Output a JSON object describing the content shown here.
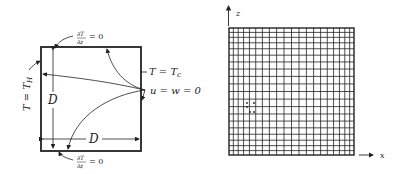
{
  "left_diagram": {
    "square": {
      "x": 41,
      "y": 47,
      "w": 100,
      "h": 104
    },
    "labels": {
      "top_bc_num": "∂T",
      "top_bc_den": "∂z",
      "top_bc_eq": "= 0",
      "bottom_bc_num": "∂T",
      "bottom_bc_den": "∂z",
      "bottom_bc_eq": "= 0",
      "left_bc": "T = T",
      "left_bc_sub": "H",
      "right_bc": "T = T",
      "right_bc_sub": "c",
      "no_slip": "u = w = 0",
      "height_dim": "D",
      "width_dim": "D"
    }
  },
  "right_diagram": {
    "grid": {
      "x": 229,
      "y": 28,
      "w": 125,
      "h": 127,
      "n_lines": 21
    },
    "axis_z_label": "z",
    "axis_x_label": "x",
    "stencil_point": {
      "x": 250,
      "y": 108
    }
  },
  "colors": {
    "ink": "#222222",
    "background": "#ffffff"
  }
}
